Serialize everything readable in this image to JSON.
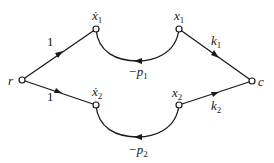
{
  "diagram": {
    "type": "signal-flow-graph",
    "nodes": [
      {
        "id": "r",
        "label": "r",
        "x": 22,
        "y": 80
      },
      {
        "id": "x1dot",
        "label": "ẋ",
        "sub": "1",
        "x": 96,
        "y": 29
      },
      {
        "id": "x1",
        "label": "x",
        "sub": "1",
        "x": 179,
        "y": 29
      },
      {
        "id": "c",
        "label": "c",
        "x": 252,
        "y": 81
      },
      {
        "id": "x2dot",
        "label": "ẋ",
        "sub": "2",
        "x": 96,
        "y": 105
      },
      {
        "id": "x2",
        "label": "x",
        "sub": "2",
        "x": 179,
        "y": 105
      }
    ],
    "edges": [
      {
        "from": "r",
        "to": "x1dot",
        "gain": "1"
      },
      {
        "from": "r",
        "to": "x2dot",
        "gain": "1"
      },
      {
        "from": "x1",
        "to": "x1dot",
        "gain": "−p",
        "gain_sub": "1",
        "curved": true
      },
      {
        "from": "x2",
        "to": "x2dot",
        "gain": "−p",
        "gain_sub": "2",
        "curved": true
      },
      {
        "from": "x1",
        "to": "c",
        "gain": "k",
        "gain_sub": "1"
      },
      {
        "from": "x2",
        "to": "c",
        "gain": "k",
        "gain_sub": "2"
      }
    ],
    "labels": {
      "r": "r",
      "c": "c",
      "x1dot": "ẋ",
      "x1dot_sub": "1",
      "x1": "x",
      "x1_sub": "1",
      "x2dot": "ẋ",
      "x2dot_sub": "2",
      "x2": "x",
      "x2_sub": "2",
      "gain_r_x1dot": "1",
      "gain_r_x2dot": "1",
      "loop1": "−p",
      "loop1_sub": "1",
      "loop2": "−p",
      "loop2_sub": "2",
      "k1": "k",
      "k1_sub": "1",
      "k2": "k",
      "k2_sub": "2"
    },
    "colors": {
      "stroke": "#1a1a1a",
      "background": "#ffffff"
    }
  }
}
